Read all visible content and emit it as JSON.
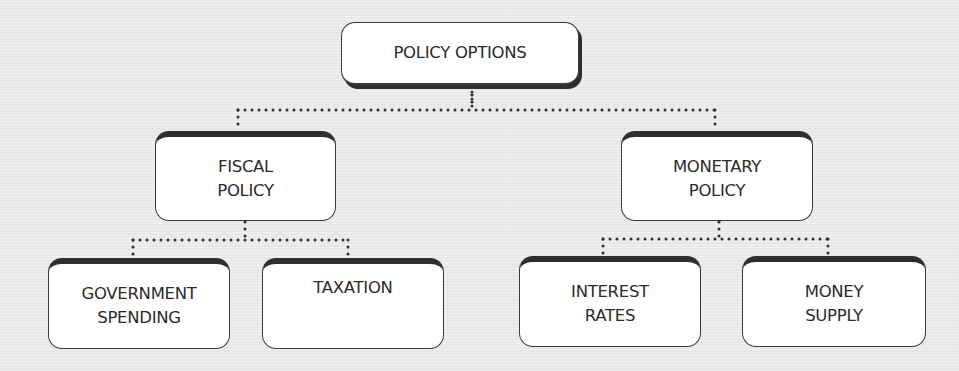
{
  "diagram": {
    "type": "hierarchy-tree",
    "root": {
      "id": "policy-options",
      "lines": [
        "POLICY OPTIONS"
      ]
    },
    "branches": [
      {
        "id": "fiscal-policy",
        "lines": [
          "FISCAL",
          "POLICY"
        ],
        "children": [
          {
            "id": "government-spending",
            "lines": [
              "GOVERNMENT",
              "SPENDING"
            ]
          },
          {
            "id": "taxation",
            "lines": [
              "TAXATION"
            ]
          }
        ]
      },
      {
        "id": "monetary-policy",
        "lines": [
          "MONETARY",
          "POLICY"
        ],
        "children": [
          {
            "id": "interest-rates",
            "lines": [
              "INTEREST",
              "RATES"
            ]
          },
          {
            "id": "money-supply",
            "lines": [
              "MONEY",
              "SUPPLY"
            ]
          }
        ]
      }
    ],
    "edges": [
      [
        "policy-options",
        "fiscal-policy"
      ],
      [
        "policy-options",
        "monetary-policy"
      ],
      [
        "fiscal-policy",
        "government-spending"
      ],
      [
        "fiscal-policy",
        "taxation"
      ],
      [
        "monetary-policy",
        "interest-rates"
      ],
      [
        "monetary-policy",
        "money-supply"
      ]
    ],
    "colors": {
      "background": "#ebebeb",
      "node_fill": "#ffffff",
      "node_border": "#3a3a3a",
      "connector": "#2f2f2f",
      "text": "#2b2b2b"
    }
  }
}
